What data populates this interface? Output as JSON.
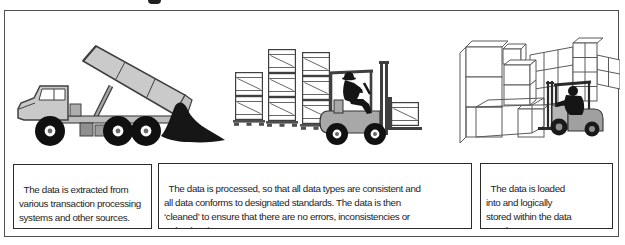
{
  "figure": {
    "frame_border_color": "#4f4f4f",
    "background_color": "#ffffff",
    "crop_remnant": "partial descender of cropped caption text above frame"
  },
  "palette": {
    "outline": "#3f3f3f",
    "truck_gray": "#c9c9c9",
    "forklift_gray": "#a8a8a8",
    "silhouette_black": "#151515",
    "text_color": "#1d1d1d"
  },
  "panels": [
    {
      "id": "extract",
      "illustration": "dump-truck",
      "caption_lines": [
        "The data is extracted from",
        "various transaction processing",
        "systems and other sources."
      ]
    },
    {
      "id": "transform",
      "illustration": "forklift-stacking-crates",
      "caption_lines": [
        "The data is processed, so that all data types are consistent and",
        "all data conforms to designated standards. The data is then",
        "‘cleaned’ to ensure that there are no errors, inconsistencies or",
        "redundancies."
      ]
    },
    {
      "id": "load",
      "illustration": "forklift-loading-warehouse",
      "caption_lines": [
        "The data is loaded",
        "into and logically",
        "stored within the data",
        "warehouse."
      ]
    }
  ]
}
